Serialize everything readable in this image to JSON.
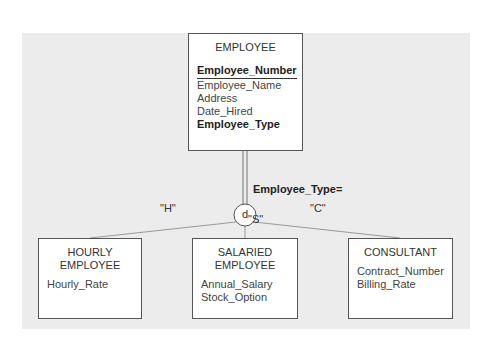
{
  "diagram": {
    "type": "EER specialization diagram",
    "supertype": {
      "name": "EMPLOYEE",
      "attributes": [
        {
          "name": "Employee_Number",
          "key": true
        },
        {
          "name": "Employee_Name",
          "key": false
        },
        {
          "name": "Address",
          "key": false
        },
        {
          "name": "Date_Hired",
          "key": false
        },
        {
          "name": "Employee_Type",
          "key": false,
          "discriminator": true
        }
      ]
    },
    "discriminator_label": "Employee_Type=",
    "constraint_symbol": "d",
    "subtypes": [
      {
        "name_line1": "HOURLY",
        "name_line2": "EMPLOYEE",
        "value": "\"H\"",
        "attributes": [
          "Hourly_Rate"
        ]
      },
      {
        "name_line1": "SALARIED",
        "name_line2": "EMPLOYEE",
        "value": "\"S\"",
        "attributes": [
          "Annual_Salary",
          "Stock_Option"
        ]
      },
      {
        "name_line1": "CONSULTANT",
        "name_line2": "",
        "value": "\"C\"",
        "attributes": [
          "Contract_Number",
          "Billing_Rate"
        ]
      }
    ],
    "colors": {
      "background_panel": "#ececec",
      "box_fill": "#ffffff",
      "line": "#888888",
      "border": "#555555"
    }
  }
}
